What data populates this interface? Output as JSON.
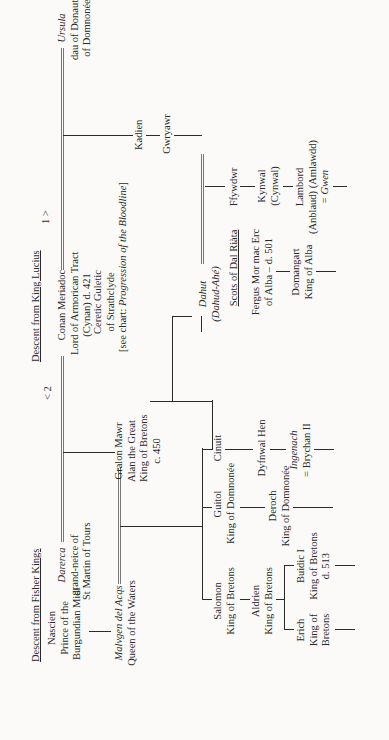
{
  "headings": {
    "fisher_kings": "Descent from Fisher Kings",
    "king_lucius": "Descent from King Lucius",
    "dal_riata": "Scots of Dal Riàta"
  },
  "markers": {
    "left": "< 2",
    "right": "1 >"
  },
  "people": {
    "nascien": [
      "Nascien",
      "Prince of the",
      "Burgundian Midi"
    ],
    "darerca": [
      "Darerca",
      "grand-neice of",
      "St Martin of Tours"
    ],
    "conan": [
      "Conan Meriadoc",
      "Lord of Armorican Tract",
      "(Cynan) d. 421"
    ],
    "ursula": [
      "Ursula",
      "dau of Donaut of",
      "of Domnonée"
    ],
    "malvgen": [
      "Malvgen del Acqs",
      "Queen of the Waters"
    ],
    "gralon": [
      "Gralon Mawr",
      "Alan the Great",
      "King of Bretons",
      "c. 450"
    ],
    "ceretic": [
      "Ceretic Guletic",
      "of Strathclyde"
    ],
    "ceretic_note_prefix": "[see chart: ",
    "ceretic_note_title": "Progression of the Bloodline",
    "ceretic_note_suffix": "]",
    "kadien": "Kadien",
    "gwrgawr": "Gwryawr",
    "salomon": [
      "Salomon",
      "King of Bretons"
    ],
    "guitol": [
      "Guitol",
      "King of Domnonée"
    ],
    "cinuit": "Cinuit",
    "dahut": [
      "Dahut",
      "(Dahud-Ahé)"
    ],
    "ffywdwr": "Ffywdwr",
    "aldrien": [
      "Aldrien",
      "King of Bretons"
    ],
    "deroch": [
      "Deroch",
      "King of Domnonée"
    ],
    "dyfnwal": "Dyfnwal Hen",
    "fergus": [
      "Fergus Mor mac Erc",
      "of Alba – d. 501"
    ],
    "kynwal": [
      "Kynwal",
      "(Cynwal)"
    ],
    "erich": [
      "Erich",
      "King of",
      "Bretons"
    ],
    "buidic": [
      "Buidic I",
      "King of Bretons",
      "d. 513"
    ],
    "ingenach": [
      "Ingenach",
      "= Brychan II"
    ],
    "domangart": [
      "Domangart",
      "King of Alba"
    ],
    "lambord": [
      "Lambord",
      "(Anblaud) (Amlawdd)",
      "= Gwen"
    ]
  }
}
